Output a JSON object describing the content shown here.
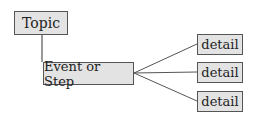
{
  "diagram": {
    "topic": {
      "label": "Topic"
    },
    "event": {
      "label": "Event or Step"
    },
    "details": [
      {
        "label": "detail"
      },
      {
        "label": "detail"
      },
      {
        "label": "detail"
      }
    ]
  },
  "colors": {
    "box_fill": "#e3e3e3",
    "border": "#555555",
    "line": "#555555"
  }
}
